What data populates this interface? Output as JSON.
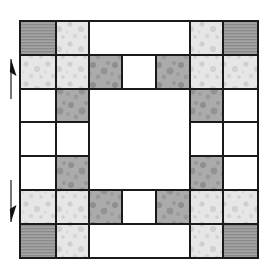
{
  "figure": {
    "type": "grid-diagram",
    "canvas": {
      "width": 269,
      "height": 277
    },
    "bounds": {
      "x": 20,
      "y": 21,
      "width": 238,
      "height": 237
    },
    "fill_legend": [
      {
        "key": "white",
        "label": "plain white patch",
        "color": "#ffffff"
      },
      {
        "key": "hatch",
        "label": "horizontal line shaded patch",
        "color": "#9a9a9a"
      },
      {
        "key": "light",
        "label": "light speckled patch",
        "color": "#e2e2e2"
      },
      {
        "key": "dark",
        "label": "dark speckled patch",
        "color": "#a6a6a6"
      }
    ],
    "outline_color": "#1a1a1a",
    "grid": {
      "columns": 7,
      "rows": 7,
      "col_edges": [
        20,
        56,
        89,
        122,
        156,
        190,
        223,
        258
      ],
      "row_edges": [
        21,
        55,
        89,
        122,
        156,
        190,
        224,
        258
      ]
    },
    "cells": [
      {
        "r": 0,
        "c": 0,
        "w": 1,
        "h": 1,
        "fill": "hatch",
        "name": "cell-r0c0"
      },
      {
        "r": 0,
        "c": 1,
        "w": 1,
        "h": 1,
        "fill": "light",
        "name": "cell-r0c1"
      },
      {
        "r": 0,
        "c": 2,
        "w": 3,
        "h": 1,
        "fill": "white",
        "name": "cell-r0c2-span3"
      },
      {
        "r": 0,
        "c": 5,
        "w": 1,
        "h": 1,
        "fill": "light",
        "name": "cell-r0c5"
      },
      {
        "r": 0,
        "c": 6,
        "w": 1,
        "h": 1,
        "fill": "hatch",
        "name": "cell-r0c6"
      },
      {
        "r": 1,
        "c": 0,
        "w": 1,
        "h": 1,
        "fill": "light",
        "name": "cell-r1c0"
      },
      {
        "r": 1,
        "c": 1,
        "w": 1,
        "h": 1,
        "fill": "light",
        "name": "cell-r1c1"
      },
      {
        "r": 1,
        "c": 2,
        "w": 1,
        "h": 1,
        "fill": "dark",
        "name": "cell-r1c2"
      },
      {
        "r": 1,
        "c": 3,
        "w": 1,
        "h": 1,
        "fill": "white",
        "name": "cell-r1c3"
      },
      {
        "r": 1,
        "c": 4,
        "w": 1,
        "h": 1,
        "fill": "dark",
        "name": "cell-r1c4"
      },
      {
        "r": 1,
        "c": 5,
        "w": 1,
        "h": 1,
        "fill": "light",
        "name": "cell-r1c5"
      },
      {
        "r": 1,
        "c": 6,
        "w": 1,
        "h": 1,
        "fill": "light",
        "name": "cell-r1c6"
      },
      {
        "r": 2,
        "c": 0,
        "w": 1,
        "h": 1,
        "fill": "white",
        "name": "cell-r2c0"
      },
      {
        "r": 2,
        "c": 1,
        "w": 1,
        "h": 1,
        "fill": "dark",
        "name": "cell-r2c1"
      },
      {
        "r": 2,
        "c": 2,
        "w": 3,
        "h": 3,
        "fill": "white",
        "name": "cell-center-span"
      },
      {
        "r": 2,
        "c": 5,
        "w": 1,
        "h": 1,
        "fill": "dark",
        "name": "cell-r2c5"
      },
      {
        "r": 2,
        "c": 6,
        "w": 1,
        "h": 1,
        "fill": "white",
        "name": "cell-r2c6"
      },
      {
        "r": 3,
        "c": 0,
        "w": 1,
        "h": 1,
        "fill": "white",
        "name": "cell-r3c0"
      },
      {
        "r": 3,
        "c": 1,
        "w": 1,
        "h": 1,
        "fill": "white",
        "name": "cell-r3c1"
      },
      {
        "r": 3,
        "c": 5,
        "w": 1,
        "h": 1,
        "fill": "white",
        "name": "cell-r3c5"
      },
      {
        "r": 3,
        "c": 6,
        "w": 1,
        "h": 1,
        "fill": "white",
        "name": "cell-r3c6"
      },
      {
        "r": 4,
        "c": 0,
        "w": 1,
        "h": 1,
        "fill": "white",
        "name": "cell-r4c0"
      },
      {
        "r": 4,
        "c": 1,
        "w": 1,
        "h": 1,
        "fill": "dark",
        "name": "cell-r4c1"
      },
      {
        "r": 4,
        "c": 5,
        "w": 1,
        "h": 1,
        "fill": "dark",
        "name": "cell-r4c5"
      },
      {
        "r": 4,
        "c": 6,
        "w": 1,
        "h": 1,
        "fill": "white",
        "name": "cell-r4c6"
      },
      {
        "r": 5,
        "c": 0,
        "w": 1,
        "h": 1,
        "fill": "light",
        "name": "cell-r5c0"
      },
      {
        "r": 5,
        "c": 1,
        "w": 1,
        "h": 1,
        "fill": "light",
        "name": "cell-r5c1"
      },
      {
        "r": 5,
        "c": 2,
        "w": 1,
        "h": 1,
        "fill": "dark",
        "name": "cell-r5c2"
      },
      {
        "r": 5,
        "c": 3,
        "w": 1,
        "h": 1,
        "fill": "white",
        "name": "cell-r5c3"
      },
      {
        "r": 5,
        "c": 4,
        "w": 1,
        "h": 1,
        "fill": "dark",
        "name": "cell-r5c4"
      },
      {
        "r": 5,
        "c": 5,
        "w": 1,
        "h": 1,
        "fill": "light",
        "name": "cell-r5c5"
      },
      {
        "r": 5,
        "c": 6,
        "w": 1,
        "h": 1,
        "fill": "light",
        "name": "cell-r5c6"
      },
      {
        "r": 6,
        "c": 0,
        "w": 1,
        "h": 1,
        "fill": "hatch",
        "name": "cell-r6c0"
      },
      {
        "r": 6,
        "c": 1,
        "w": 1,
        "h": 1,
        "fill": "light",
        "name": "cell-r6c1"
      },
      {
        "r": 6,
        "c": 2,
        "w": 3,
        "h": 1,
        "fill": "white",
        "name": "cell-r6c2-span3"
      },
      {
        "r": 6,
        "c": 5,
        "w": 1,
        "h": 1,
        "fill": "light",
        "name": "cell-r6c5"
      },
      {
        "r": 6,
        "c": 6,
        "w": 1,
        "h": 1,
        "fill": "hatch",
        "name": "cell-r6c6"
      }
    ],
    "annotations": [
      {
        "name": "arrow-up-marker",
        "icon": "arrow-up-icon",
        "direction": "up",
        "x": 11,
        "y_top": 59,
        "y_bottom": 99
      },
      {
        "name": "arrow-down-marker",
        "icon": "arrow-down-icon",
        "direction": "down",
        "x": 11,
        "y_top": 180,
        "y_bottom": 222
      }
    ]
  }
}
